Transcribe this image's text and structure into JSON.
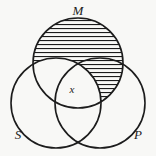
{
  "figure": {
    "kind": "venn-diagram",
    "title": "",
    "background_color": "#f8f8f6",
    "stroke_color": "#1c1c1c",
    "hatch_color": "#1c1c1c"
  },
  "sets": {
    "major": {
      "label": "M",
      "name": "middle-term-circle",
      "cx": 78,
      "cy": 63,
      "r": 45,
      "label_x": 78,
      "label_y": 12
    },
    "subject": {
      "label": "S",
      "name": "subject-term-circle",
      "cx": 56,
      "cy": 103,
      "r": 45,
      "label_x": 18,
      "label_y": 136
    },
    "predicate": {
      "label": "P",
      "name": "predicate-term-circle",
      "cx": 100,
      "cy": 103,
      "r": 45,
      "label_x": 138,
      "label_y": 136
    }
  },
  "annotations": {
    "center_marker": {
      "label": "x",
      "x": 72,
      "y": 90,
      "region": "M-and-S-and-P"
    }
  },
  "shading": {
    "style": "horizontal-hatch",
    "line_spacing_px": 4,
    "line_width_px": 1.1,
    "shaded_regions": [
      "M-only",
      "M-and-P-not-S"
    ]
  },
  "chart_data": {
    "type": "diagram",
    "title": "",
    "sets": [
      "M",
      "S",
      "P"
    ],
    "regions": [
      {
        "id": "M-only",
        "label": "",
        "shaded": true
      },
      {
        "id": "M-and-S-not-P",
        "label": "",
        "shaded": false
      },
      {
        "id": "M-and-P-not-S",
        "label": "",
        "shaded": true
      },
      {
        "id": "M-and-S-and-P",
        "label": "x",
        "shaded": false
      },
      {
        "id": "S-only",
        "label": "",
        "shaded": false
      },
      {
        "id": "P-only",
        "label": "",
        "shaded": false
      },
      {
        "id": "S-and-P-not-M",
        "label": "",
        "shaded": false
      }
    ]
  }
}
